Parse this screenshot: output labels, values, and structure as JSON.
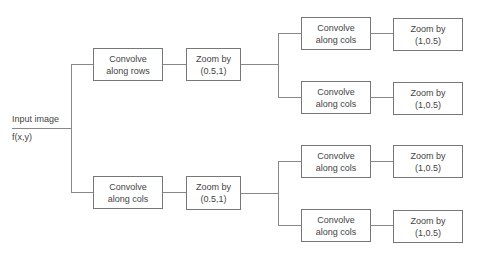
{
  "input": {
    "label": "Input image",
    "function": "f(x,y)"
  },
  "branches": [
    {
      "convolve": "Convolve\nalong rows",
      "zoom": "Zoom by\n(0.5,1)",
      "sub": [
        {
          "convolve": "Convolve\nalong cols",
          "zoom": "Zoom by\n(1,0.5)"
        },
        {
          "convolve": "Convolve\nalong cols",
          "zoom": "Zoom by\n(1,0.5)"
        }
      ]
    },
    {
      "convolve": "Convolve\nalong cols",
      "zoom": "Zoom by\n(0.5,1)",
      "sub": [
        {
          "convolve": "Convolve\nalong cols",
          "zoom": "Zoom by\n(1,0.5)"
        },
        {
          "convolve": "Convolve\nalong cols",
          "zoom": "Zoom by\n(1,0.5)"
        }
      ]
    }
  ],
  "colors": {
    "line": "#888888",
    "border": "#777777",
    "text": "#444444"
  }
}
